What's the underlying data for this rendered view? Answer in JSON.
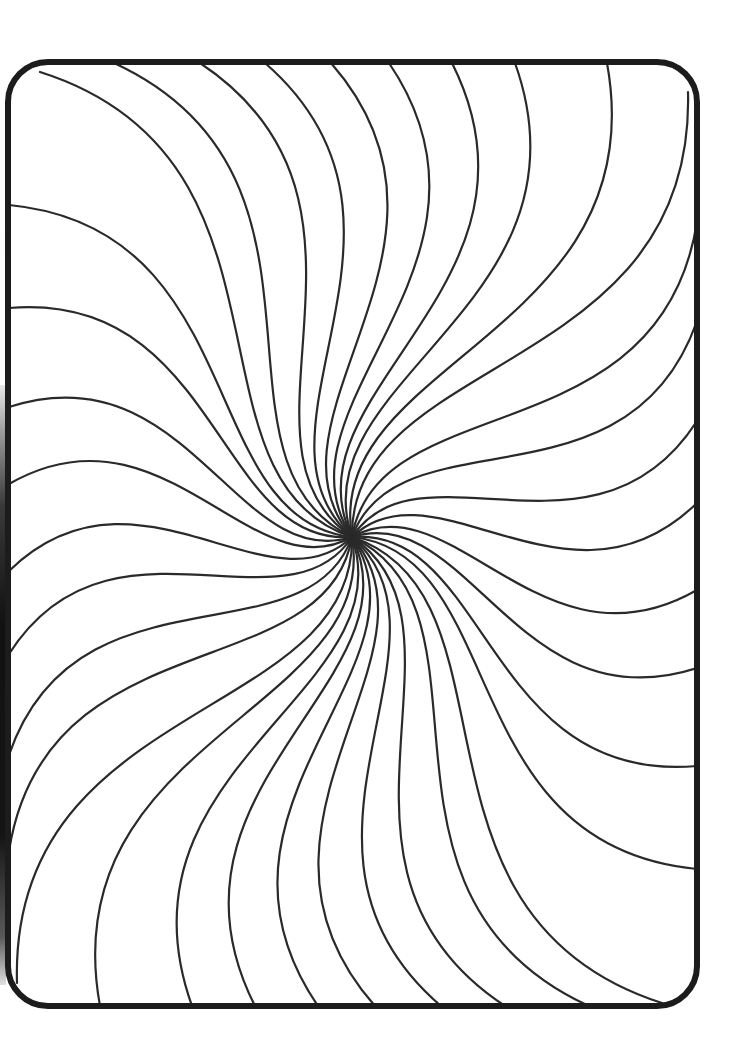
{
  "page": {
    "type": "coloring-page"
  },
  "colors": {
    "background": "#ffffff",
    "line": "#2a2a2a",
    "border": "#1c1c1c"
  },
  "frame": {
    "x": 8,
    "y": 62,
    "width": 689,
    "height": 944,
    "radius": 40,
    "stroke_width": 6
  },
  "swirl": {
    "center": [
      352,
      537
    ],
    "line_width": 2.2,
    "twist_start_deg": -38,
    "twist_end_deg": 28,
    "endpoints": [
      [
        40,
        72
      ],
      [
        114,
        63
      ],
      [
        200,
        63
      ],
      [
        265,
        63
      ],
      [
        331,
        63
      ],
      [
        389,
        63
      ],
      [
        452,
        63
      ],
      [
        515,
        63
      ],
      [
        607,
        63
      ],
      [
        688,
        92
      ],
      [
        697,
        222
      ],
      [
        697,
        321
      ],
      [
        697,
        421
      ],
      [
        697,
        503
      ],
      [
        697,
        590
      ],
      [
        697,
        668
      ],
      [
        697,
        766
      ],
      [
        697,
        869
      ],
      [
        662,
        1003
      ],
      [
        589,
        1006
      ],
      [
        505,
        1006
      ],
      [
        441,
        1006
      ],
      [
        375,
        1006
      ],
      [
        318,
        1006
      ],
      [
        255,
        1006
      ],
      [
        192,
        1006
      ],
      [
        100,
        1006
      ],
      [
        17,
        983
      ],
      [
        9,
        851
      ],
      [
        9,
        755
      ],
      [
        9,
        654
      ],
      [
        9,
        571
      ],
      [
        9,
        484
      ],
      [
        9,
        407
      ],
      [
        9,
        308
      ],
      [
        9,
        205
      ]
    ]
  }
}
